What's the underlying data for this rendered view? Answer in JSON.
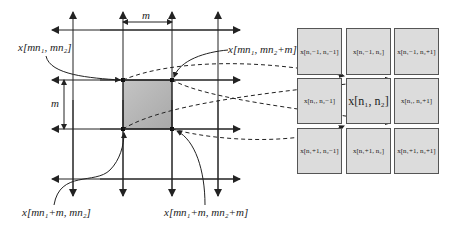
{
  "labels": {
    "block_width": "m",
    "block_height": "m",
    "top_left_sample": "x[mn₁, mn₂]",
    "top_right_sample": "x[mn₁, mn₂+m]",
    "bottom_left_sample": "x[mn₁+m, mn₂]",
    "bottom_right_sample": "x[mn₁+m, mn₂+m]"
  },
  "neighborhood": {
    "rows": [
      [
        "x[n₁−1, n₂−1]",
        "x[n₁−1, n₂]",
        "x[n₁−1, n₂+1]"
      ],
      [
        "x[n₁, n₂−1]",
        "x[n₁, n₂]",
        "x[n₁, n₂+1]"
      ],
      [
        "x[n₁+1, n₂−1]",
        "x[n₁+1, n₂]",
        "x[n₁+1, n₂+1]"
      ]
    ]
  },
  "colors": {
    "line": "#222222",
    "shaded_block": "#b8b8b8",
    "cell_fill": "#dcdcdc"
  }
}
